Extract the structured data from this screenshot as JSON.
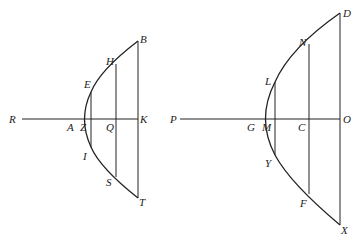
{
  "figures": [
    {
      "id": "left",
      "labels": {
        "R": "R",
        "A": "A",
        "Z": "Z",
        "Q": "Q",
        "K": "K",
        "B": "B",
        "H": "H",
        "E": "E",
        "I": "I",
        "S": "S",
        "T": "T"
      }
    },
    {
      "id": "right",
      "labels": {
        "P": "P",
        "G": "G",
        "M": "M",
        "C": "C",
        "O": "O",
        "D": "D",
        "N": "N",
        "L": "L",
        "Y": "Y",
        "F": "F",
        "X": "X"
      }
    }
  ]
}
